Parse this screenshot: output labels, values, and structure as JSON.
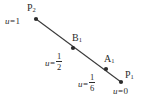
{
  "figure": {
    "type": "geometry-diagram",
    "width": 145,
    "height": 110,
    "background_color": "#ffffff",
    "line_color": "#3a3a3a",
    "text_color": "#2b2b2b"
  },
  "segment": {
    "start": {
      "x": 36,
      "y": 19
    },
    "end": {
      "x": 121,
      "y": 82
    }
  },
  "points": [
    {
      "id": "P2",
      "name": "P",
      "subscript": "2",
      "dot": {
        "x": 36,
        "y": 19
      },
      "label_pos": {
        "x": 27,
        "y": 3
      },
      "param_text": "u = 1",
      "param_value": "1",
      "param_pos": {
        "x": 5,
        "y": 17
      },
      "param_style": "plain"
    },
    {
      "id": "B1",
      "name": "B",
      "subscript": "1",
      "dot": {
        "x": 73,
        "y": 48
      },
      "label_pos": {
        "x": 72,
        "y": 33
      },
      "param_text": "u = 1/2",
      "param_numerator": "1",
      "param_denominator": "2",
      "param_pos": {
        "x": 45,
        "y": 52
      },
      "param_style": "fraction"
    },
    {
      "id": "A1",
      "name": "A",
      "subscript": "1",
      "dot": {
        "x": 106,
        "y": 69
      },
      "label_pos": {
        "x": 104,
        "y": 54
      },
      "param_text": "u = 1/6",
      "param_numerator": "1",
      "param_denominator": "6",
      "param_pos": {
        "x": 78,
        "y": 73
      },
      "param_style": "fraction"
    },
    {
      "id": "P1",
      "name": "P",
      "subscript": "1",
      "dot": {
        "x": 121,
        "y": 82
      },
      "label_pos": {
        "x": 125,
        "y": 70
      },
      "param_text": "u = 0",
      "param_value": "0",
      "param_pos": {
        "x": 113,
        "y": 87
      },
      "param_style": "plain"
    }
  ],
  "labels": {
    "p2_name": "P",
    "p2_sub": "2",
    "b1_name": "B",
    "b1_sub": "1",
    "a1_name": "A",
    "a1_sub": "1",
    "p1_name": "P",
    "p1_sub": "1",
    "u_var": "u",
    "equals": "=",
    "u_p2_value": "1",
    "u_b1_num": "1",
    "u_b1_den": "2",
    "u_a1_num": "1",
    "u_a1_den": "6",
    "u_p1_value": "0"
  }
}
